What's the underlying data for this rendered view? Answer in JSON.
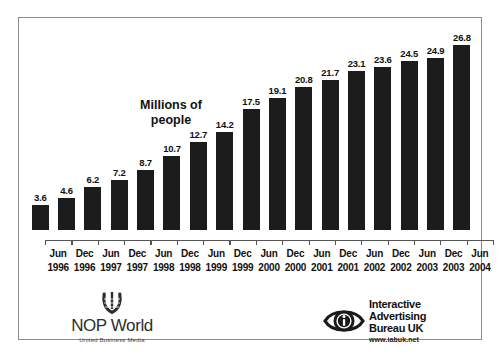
{
  "chart_data": {
    "type": "bar",
    "title": "Millions of people",
    "title_lines": [
      "Millions of",
      "people"
    ],
    "xlabel": "",
    "ylabel": "Millions of people",
    "ylim": [
      0,
      28
    ],
    "grid": false,
    "legend": "none",
    "bar_color": "#1c1c1c",
    "categories": [
      "Jun 1996",
      "Dec 1996",
      "Jun 1997",
      "Dec 1997",
      "Jun 1998",
      "Dec 1998",
      "Jun 1999",
      "Dec 1999",
      "Jun 2000",
      "Dec 2000",
      "Jun 2001",
      "Dec 2001",
      "Jun 2002",
      "Dec 2002",
      "Jun 2003",
      "Dec 2003",
      "Jun 2004"
    ],
    "values": [
      3.6,
      4.6,
      6.2,
      7.2,
      8.7,
      10.7,
      12.7,
      14.2,
      17.5,
      19.1,
      20.8,
      21.7,
      23.1,
      23.6,
      24.5,
      24.9,
      26.8
    ],
    "points": [
      {
        "month": "Jun",
        "year": "1996",
        "value": 3.6,
        "label": "3.6"
      },
      {
        "month": "Dec",
        "year": "1996",
        "value": 4.6,
        "label": "4.6"
      },
      {
        "month": "Jun",
        "year": "1997",
        "value": 6.2,
        "label": "6.2"
      },
      {
        "month": "Dec",
        "year": "1997",
        "value": 7.2,
        "label": "7.2"
      },
      {
        "month": "Jun",
        "year": "1998",
        "value": 8.7,
        "label": "8.7"
      },
      {
        "month": "Dec",
        "year": "1998",
        "value": 10.7,
        "label": "10.7"
      },
      {
        "month": "Jun",
        "year": "1999",
        "value": 12.7,
        "label": "12.7"
      },
      {
        "month": "Dec",
        "year": "1999",
        "value": 14.2,
        "label": "14.2"
      },
      {
        "month": "Jun",
        "year": "2000",
        "value": 17.5,
        "label": "17.5"
      },
      {
        "month": "Dec",
        "year": "2000",
        "value": 19.1,
        "label": "19.1"
      },
      {
        "month": "Jun",
        "year": "2001",
        "value": 20.8,
        "label": "20.8"
      },
      {
        "month": "Dec",
        "year": "2001",
        "value": 21.7,
        "label": "21.7"
      },
      {
        "month": "Jun",
        "year": "2002",
        "value": 23.1,
        "label": "23.1"
      },
      {
        "month": "Dec",
        "year": "2002",
        "value": 23.6,
        "label": "23.6"
      },
      {
        "month": "Jun",
        "year": "2003",
        "value": 24.5,
        "label": "24.5"
      },
      {
        "month": "Dec",
        "year": "2003",
        "value": 24.9,
        "label": "24.9"
      },
      {
        "month": "Jun",
        "year": "2004",
        "value": 26.8,
        "label": "26.8"
      }
    ]
  },
  "footer": {
    "nop": {
      "wordmark": "NOP World",
      "tagline": "United Business Media",
      "mark_icon": "laurel-wreath-icon"
    },
    "iab": {
      "lines": [
        "Interactive",
        "Advertising",
        "Bureau UK"
      ],
      "url": "www.iabuk.net",
      "mark_icon": "eye-i-icon"
    }
  },
  "colors": {
    "bar": "#1c1c1c",
    "frame": "#8c8c8c",
    "axis": "#555555",
    "text": "#111111",
    "background": "#ffffff"
  }
}
